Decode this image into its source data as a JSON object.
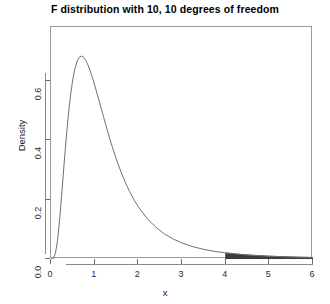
{
  "chart_data": {
    "type": "line",
    "title": "F distribution with 10, 10 degrees of freedom",
    "xlabel": "x",
    "ylabel": "Density",
    "xlim": [
      0,
      6
    ],
    "ylim": [
      0,
      0.78
    ],
    "grid": false,
    "legend": null,
    "xticks": [
      "0",
      "1",
      "2",
      "3",
      "4",
      "5",
      "6"
    ],
    "xtick_values": [
      0,
      1,
      2,
      3,
      4,
      5,
      6
    ],
    "yticks": [
      "0.0",
      "0.2",
      "0.4",
      "0.6"
    ],
    "ytick_values": [
      0.0,
      0.2,
      0.4,
      0.6
    ],
    "curve_color": "#707070",
    "shade_color": "#3d3d3d",
    "series": [
      {
        "name": "F(10,10) density",
        "x": [
          0.0,
          0.05,
          0.1,
          0.15,
          0.2,
          0.25,
          0.3,
          0.35,
          0.4,
          0.45,
          0.5,
          0.55,
          0.6,
          0.65,
          0.7,
          0.75,
          0.8,
          0.85,
          0.9,
          0.95,
          1.0,
          1.1,
          1.2,
          1.3,
          1.4,
          1.5,
          1.6,
          1.7,
          1.8,
          1.9,
          2.0,
          2.2,
          2.4,
          2.6,
          2.8,
          3.0,
          3.25,
          3.5,
          3.75,
          4.0,
          4.25,
          4.5,
          4.75,
          5.0,
          5.25,
          5.5,
          5.75,
          6.0
        ],
        "y": [
          0.0,
          0.0017,
          0.0182,
          0.0627,
          0.1356,
          0.2257,
          0.3201,
          0.4096,
          0.4884,
          0.5536,
          0.6045,
          0.6415,
          0.6657,
          0.6787,
          0.6822,
          0.6777,
          0.6669,
          0.6511,
          0.6315,
          0.6091,
          0.5848,
          0.5329,
          0.4793,
          0.4273,
          0.3785,
          0.3339,
          0.2938,
          0.2582,
          0.2268,
          0.1993,
          0.1753,
          0.1364,
          0.1068,
          0.0843,
          0.0671,
          0.0539,
          0.0414,
          0.0323,
          0.0256,
          0.0205,
          0.0167,
          0.0137,
          0.0113,
          0.0095,
          0.008,
          0.0068,
          0.0058,
          0.005
        ]
      }
    ],
    "shaded_region": {
      "label": "upper tail",
      "x_start": 4,
      "x_end": 6,
      "x": [
        4.0,
        4.25,
        4.5,
        4.75,
        5.0,
        5.25,
        5.5,
        5.75,
        6.0
      ],
      "y": [
        0.0205,
        0.0167,
        0.0137,
        0.0113,
        0.0095,
        0.008,
        0.0068,
        0.0058,
        0.005
      ]
    }
  }
}
